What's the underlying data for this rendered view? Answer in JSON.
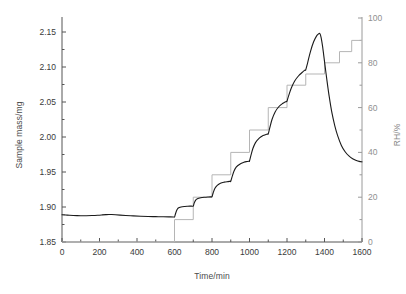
{
  "chart_data": {
    "type": "line",
    "title": "",
    "xlabel": "Time/min",
    "ylabel": "Sample mass/mg",
    "y2label": "RH/%",
    "xlim": [
      0,
      1600
    ],
    "ylim": [
      1.85,
      2.17
    ],
    "y2lim": [
      0,
      100
    ],
    "grid": false,
    "legend": "none",
    "xticks": [
      0,
      200,
      400,
      600,
      800,
      1000,
      1200,
      1400,
      1600
    ],
    "xticklabels": [
      "0",
      "200",
      "400",
      "600",
      "800",
      "1000",
      "1200",
      "1400",
      "1600"
    ],
    "yticks": [
      1.85,
      1.9,
      1.95,
      2.0,
      2.05,
      2.1,
      2.15
    ],
    "yticklabels": [
      "1.85",
      "1.90",
      "1.95",
      "2.00",
      "2.05",
      "2.10",
      "2.15"
    ],
    "y2ticks": [
      0,
      20,
      40,
      60,
      80,
      100
    ],
    "y2ticklabels": [
      "0",
      "20",
      "40",
      "60",
      "80",
      "100"
    ],
    "yminor_step": 0.025,
    "y2minor_step": 10,
    "xminor_step": 100,
    "series": [
      {
        "name": "Sample mass",
        "axis": "left",
        "color": "#1a1a1a",
        "width": 1.1,
        "style": "smooth",
        "x": [
          0,
          20,
          40,
          60,
          80,
          100,
          130,
          160,
          190,
          215,
          235,
          250,
          265,
          285,
          310,
          340,
          380,
          420,
          460,
          500,
          540,
          570,
          595,
          600,
          605,
          612,
          620,
          635,
          655,
          670,
          690,
          700,
          705,
          712,
          722,
          740,
          760,
          780,
          795,
          800,
          806,
          815,
          828,
          845,
          865,
          885,
          897,
          900,
          907,
          917,
          930,
          950,
          970,
          985,
          997,
          1000,
          1007,
          1018,
          1032,
          1052,
          1072,
          1088,
          1097,
          1100,
          1108,
          1120,
          1136,
          1156,
          1176,
          1190,
          1198,
          1200,
          1209,
          1223,
          1241,
          1262,
          1282,
          1292,
          1299,
          1300,
          1310,
          1325,
          1342,
          1358,
          1368,
          1375,
          1382,
          1390,
          1400,
          1412,
          1425,
          1440,
          1455,
          1470,
          1490,
          1510,
          1530,
          1550,
          1570,
          1585,
          1600
        ],
        "y": [
          1.889,
          1.8886,
          1.8882,
          1.8879,
          1.8877,
          1.8876,
          1.8876,
          1.8878,
          1.8882,
          1.8887,
          1.8891,
          1.8893,
          1.8892,
          1.8889,
          1.8884,
          1.8879,
          1.8873,
          1.8868,
          1.8864,
          1.8862,
          1.886,
          1.8859,
          1.8858,
          1.8858,
          1.89,
          1.8955,
          1.8985,
          1.9,
          1.9008,
          1.9011,
          1.9013,
          1.9014,
          1.9055,
          1.9095,
          1.9118,
          1.9132,
          1.9139,
          1.9143,
          1.9145,
          1.9146,
          1.92,
          1.9265,
          1.931,
          1.934,
          1.9355,
          1.9363,
          1.9367,
          1.9368,
          1.943,
          1.951,
          1.9572,
          1.9615,
          1.9638,
          1.9649,
          1.9654,
          1.9655,
          1.973,
          1.9835,
          1.992,
          1.9985,
          2.002,
          2.0036,
          2.0043,
          2.0045,
          2.013,
          2.025,
          2.0355,
          2.0432,
          2.0478,
          2.05,
          2.051,
          2.0512,
          2.059,
          2.07,
          2.08,
          2.0875,
          2.0925,
          2.0948,
          2.0958,
          2.096,
          2.106,
          2.122,
          2.136,
          2.1445,
          2.1472,
          2.1478,
          2.142,
          2.129,
          2.108,
          2.083,
          2.058,
          2.034,
          2.016,
          2.002,
          1.988,
          1.979,
          1.973,
          1.969,
          1.9665,
          1.9652,
          1.9645
        ]
      },
      {
        "name": "RH",
        "axis": "right",
        "color": "#b5b5b5",
        "width": 1.0,
        "style": "step",
        "steps": [
          {
            "x_start": 0,
            "x_end": 600,
            "value": 0
          },
          {
            "x_start": 600,
            "x_end": 700,
            "value": 10
          },
          {
            "x_start": 700,
            "x_end": 800,
            "value": 20
          },
          {
            "x_start": 800,
            "x_end": 900,
            "value": 30
          },
          {
            "x_start": 900,
            "x_end": 1000,
            "value": 40
          },
          {
            "x_start": 1000,
            "x_end": 1100,
            "value": 50
          },
          {
            "x_start": 1100,
            "x_end": 1200,
            "value": 60
          },
          {
            "x_start": 1200,
            "x_end": 1300,
            "value": 70
          },
          {
            "x_start": 1300,
            "x_end": 1400,
            "value": 75
          },
          {
            "x_start": 1400,
            "x_end": 1480,
            "value": 80
          },
          {
            "x_start": 1480,
            "x_end": 1545,
            "value": 85
          },
          {
            "x_start": 1545,
            "x_end": 1600,
            "value": 90
          }
        ]
      }
    ],
    "annotations": [],
    "colors": {
      "mass_line": "#1a1a1a",
      "rh_line": "#b5b5b5",
      "left_axis": "#555555",
      "right_axis": "#9a9a9a",
      "background": "#ffffff"
    }
  }
}
